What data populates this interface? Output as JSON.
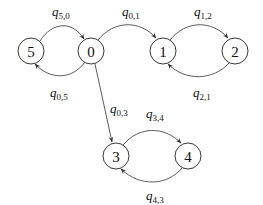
{
  "diagram": {
    "type": "state-transition-graph",
    "nodes": [
      {
        "id": "5",
        "label": "5",
        "x": 31,
        "y": 51
      },
      {
        "id": "0",
        "label": "0",
        "x": 91,
        "y": 51
      },
      {
        "id": "1",
        "label": "1",
        "x": 163,
        "y": 51
      },
      {
        "id": "2",
        "label": "2",
        "x": 235,
        "y": 51
      },
      {
        "id": "3",
        "label": "3",
        "x": 116,
        "y": 156
      },
      {
        "id": "4",
        "label": "4",
        "x": 188,
        "y": 156
      }
    ],
    "edges": [
      {
        "from": "5",
        "to": "0",
        "label_q": "q",
        "label_sub": "5,0"
      },
      {
        "from": "0",
        "to": "5",
        "label_q": "q",
        "label_sub": "0,5"
      },
      {
        "from": "0",
        "to": "1",
        "label_q": "q",
        "label_sub": "0,1"
      },
      {
        "from": "1",
        "to": "2",
        "label_q": "q",
        "label_sub": "1,2"
      },
      {
        "from": "2",
        "to": "1",
        "label_q": "q",
        "label_sub": "2,1"
      },
      {
        "from": "0",
        "to": "3",
        "label_q": "q",
        "label_sub": "0,3"
      },
      {
        "from": "3",
        "to": "4",
        "label_q": "q",
        "label_sub": "3,4"
      },
      {
        "from": "4",
        "to": "3",
        "label_q": "q",
        "label_sub": "4,3"
      }
    ]
  }
}
